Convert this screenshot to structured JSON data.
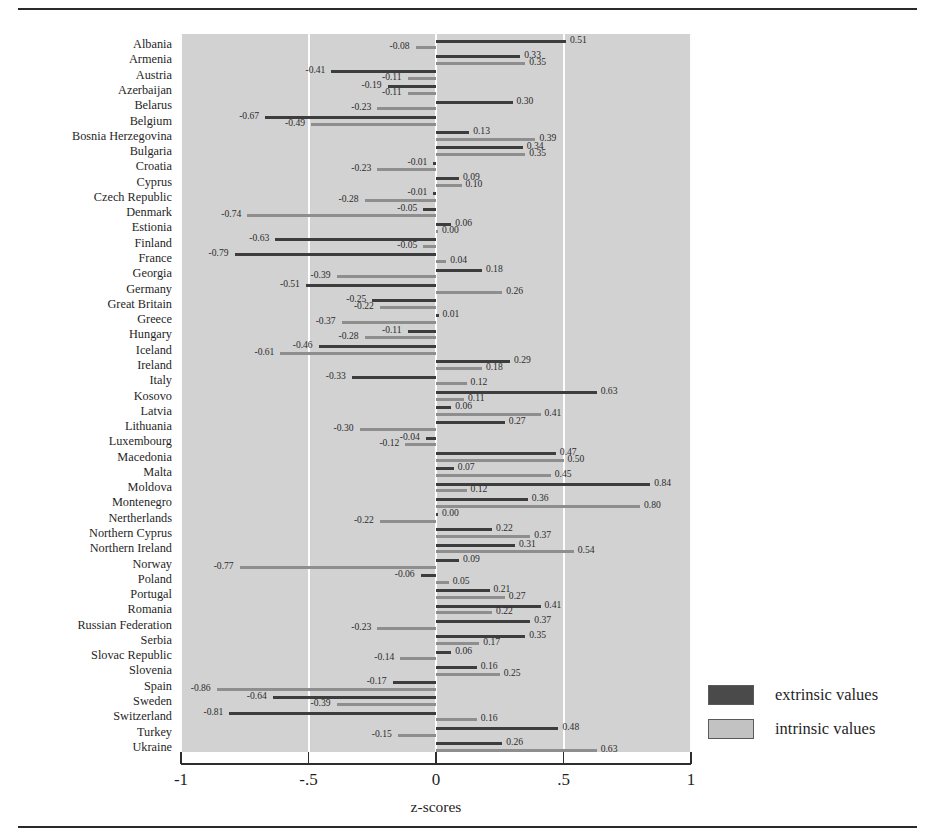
{
  "chart_data": {
    "type": "bar",
    "orientation": "horizontal",
    "title": "",
    "xlabel": "z-scores",
    "ylabel": "",
    "xlim": [
      -1,
      1
    ],
    "xticks": [
      -1,
      -0.5,
      0,
      0.5,
      1
    ],
    "xticklabels": [
      "-1",
      "-.5",
      "0",
      ".5",
      "1"
    ],
    "grid": true,
    "gridlines_at": [
      -1,
      -0.5,
      0,
      0.5,
      1
    ],
    "legend_position": "right",
    "legend": [
      "extrinsic values",
      "intrinsic values"
    ],
    "categories": [
      "Albania",
      "Armenia",
      "Austria",
      "Azerbaijan",
      "Belarus",
      "Belgium",
      "Bosnia Herzegovina",
      "Bulgaria",
      "Croatia",
      "Cyprus",
      "Czech Republic",
      "Denmark",
      "Estionia",
      "Finland",
      "France",
      "Georgia",
      "Germany",
      "Great Britain",
      "Greece",
      "Hungary",
      "Iceland",
      "Ireland",
      "Italy",
      "Kosovo",
      "Latvia",
      "Lithuania",
      "Luxembourg",
      "Macedonia",
      "Malta",
      "Moldova",
      "Montenegro",
      "Nertherlands",
      "Northern Cyprus",
      "Northern Ireland",
      "Norway",
      "Poland",
      "Portugal",
      "Romania",
      "Russian Federation",
      "Serbia",
      "Slovac Republic",
      "Slovenia",
      "Spain",
      "Sweden",
      "Switzerland",
      "Turkey",
      "Ukraine"
    ],
    "series": [
      {
        "name": "extrinsic values",
        "color": "#3d3d3d",
        "values": [
          0.51,
          0.33,
          -0.41,
          -0.19,
          0.3,
          -0.67,
          0.13,
          0.34,
          -0.01,
          0.09,
          -0.01,
          -0.05,
          0.06,
          -0.63,
          -0.79,
          0.18,
          -0.51,
          -0.25,
          0.01,
          -0.11,
          -0.46,
          0.29,
          -0.33,
          0.63,
          0.06,
          0.27,
          -0.04,
          0.47,
          0.07,
          0.84,
          0.36,
          0.0,
          0.22,
          0.31,
          0.09,
          -0.06,
          0.21,
          0.41,
          0.37,
          0.35,
          0.06,
          0.16,
          -0.17,
          -0.64,
          -0.81,
          -0.15,
          0.48
        ]
      },
      {
        "name": "intrinsic values",
        "color": "#8e8e8e",
        "values": [
          -0.08,
          0.35,
          -0.11,
          -0.11,
          -0.23,
          -0.49,
          0.39,
          0.35,
          -0.23,
          0.1,
          -0.28,
          -0.74,
          0.0,
          -0.05,
          0.04,
          -0.39,
          0.26,
          -0.22,
          -0.37,
          -0.28,
          -0.61,
          0.18,
          0.12,
          0.11,
          0.41,
          -0.3,
          -0.12,
          0.5,
          0.45,
          0.12,
          0.8,
          -0.22,
          0.37,
          0.54,
          -0.77,
          0.05,
          0.27,
          0.22,
          -0.23,
          0.17,
          -0.14,
          0.25,
          -0.86,
          -0.39,
          0.16,
          0.63,
          0.26
        ]
      }
    ],
    "rows": [
      {
        "country": "Albania",
        "extrinsic": 0.51,
        "intrinsic": -0.08
      },
      {
        "country": "Armenia",
        "extrinsic": 0.33,
        "intrinsic": 0.35
      },
      {
        "country": "Austria",
        "extrinsic": -0.41,
        "intrinsic": -0.11
      },
      {
        "country": "Azerbaijan",
        "extrinsic": -0.19,
        "intrinsic": -0.11
      },
      {
        "country": "Belarus",
        "extrinsic": 0.3,
        "intrinsic": -0.23
      },
      {
        "country": "Belgium",
        "extrinsic": -0.67,
        "intrinsic": -0.49
      },
      {
        "country": "Bosnia Herzegovina",
        "extrinsic": 0.13,
        "intrinsic": 0.39
      },
      {
        "country": "Bulgaria",
        "extrinsic": 0.34,
        "intrinsic": 0.35
      },
      {
        "country": "Croatia",
        "extrinsic": -0.01,
        "intrinsic": -0.23
      },
      {
        "country": "Cyprus",
        "extrinsic": 0.09,
        "intrinsic": 0.1
      },
      {
        "country": "Czech Republic",
        "extrinsic": -0.01,
        "intrinsic": -0.28
      },
      {
        "country": "Denmark",
        "extrinsic": -0.05,
        "intrinsic": -0.74
      },
      {
        "country": "Estionia",
        "extrinsic": 0.06,
        "intrinsic": 0.0
      },
      {
        "country": "Finland",
        "extrinsic": -0.63,
        "intrinsic": -0.05
      },
      {
        "country": "France",
        "extrinsic": -0.79,
        "intrinsic": 0.04
      },
      {
        "country": "Georgia",
        "extrinsic": 0.18,
        "intrinsic": -0.39
      },
      {
        "country": "Germany",
        "extrinsic": -0.51,
        "intrinsic": 0.26
      },
      {
        "country": "Great Britain",
        "extrinsic": -0.25,
        "intrinsic": -0.22
      },
      {
        "country": "Greece",
        "extrinsic": 0.01,
        "intrinsic": -0.37
      },
      {
        "country": "Hungary",
        "extrinsic": -0.11,
        "intrinsic": -0.28
      },
      {
        "country": "Iceland",
        "extrinsic": -0.46,
        "intrinsic": -0.61
      },
      {
        "country": "Ireland",
        "extrinsic": 0.29,
        "intrinsic": 0.18
      },
      {
        "country": "Italy",
        "extrinsic": -0.33,
        "intrinsic": 0.12
      },
      {
        "country": "Kosovo",
        "extrinsic": 0.63,
        "intrinsic": 0.11
      },
      {
        "country": "Latvia",
        "extrinsic": 0.06,
        "intrinsic": 0.41
      },
      {
        "country": "Lithuania",
        "extrinsic": 0.27,
        "intrinsic": -0.3
      },
      {
        "country": "Luxembourg",
        "extrinsic": -0.04,
        "intrinsic": -0.12
      },
      {
        "country": "Macedonia",
        "extrinsic": 0.47,
        "intrinsic": 0.5
      },
      {
        "country": "Malta",
        "extrinsic": 0.07,
        "intrinsic": 0.45
      },
      {
        "country": "Moldova",
        "extrinsic": 0.84,
        "intrinsic": 0.12
      },
      {
        "country": "Montenegro",
        "extrinsic": 0.36,
        "intrinsic": 0.8
      },
      {
        "country": "Nertherlands",
        "extrinsic": 0.0,
        "intrinsic": -0.22
      },
      {
        "country": "Northern Cyprus",
        "extrinsic": 0.22,
        "intrinsic": 0.37
      },
      {
        "country": "Northern Ireland",
        "extrinsic": 0.31,
        "intrinsic": 0.54
      },
      {
        "country": "Norway",
        "extrinsic": 0.09,
        "intrinsic": -0.77
      },
      {
        "country": "Poland",
        "extrinsic": -0.06,
        "intrinsic": 0.05
      },
      {
        "country": "Portugal",
        "extrinsic": 0.21,
        "intrinsic": 0.27
      },
      {
        "country": "Romania",
        "extrinsic": 0.41,
        "intrinsic": 0.22
      },
      {
        "country": "Russian Federation",
        "extrinsic": 0.37,
        "intrinsic": -0.23
      },
      {
        "country": "Serbia",
        "extrinsic": 0.35,
        "intrinsic": 0.17
      },
      {
        "country": "Slovac Republic",
        "extrinsic": 0.06,
        "intrinsic": -0.14
      },
      {
        "country": "Slovenia",
        "extrinsic": 0.16,
        "intrinsic": 0.25
      },
      {
        "country": "Spain",
        "extrinsic": -0.17,
        "intrinsic": -0.86
      },
      {
        "country": "Sweden",
        "extrinsic": -0.64,
        "intrinsic": -0.39
      },
      {
        "country": "Switzerland",
        "extrinsic": -0.81,
        "intrinsic": 0.16
      },
      {
        "country": "Turkey",
        "extrinsic": 0.48,
        "intrinsic": -0.15
      },
      {
        "country": "Ukraine",
        "extrinsic": 0.26,
        "intrinsic": 0.63
      }
    ]
  },
  "legend": {
    "extrinsic_label": "extrinsic values",
    "intrinsic_label": "intrinsic values",
    "extrinsic_color": "#4a4a4a",
    "intrinsic_color": "#c2c2c2"
  },
  "axis": {
    "title": "z-scores",
    "ticks": [
      "-1",
      "-.5",
      "0",
      ".5",
      "1"
    ]
  }
}
